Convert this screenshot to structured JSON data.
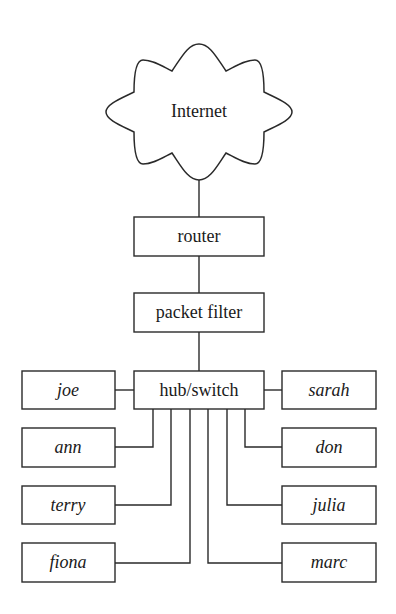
{
  "diagram": {
    "type": "network-topology",
    "colors": {
      "stroke": "#2a2a2a",
      "text": "#1a1a1a",
      "background": "#ffffff"
    },
    "nodes": {
      "internet": {
        "label": "Internet",
        "shape": "cloud"
      },
      "router": {
        "label": "router",
        "shape": "box"
      },
      "packet_filter": {
        "label": "packet filter",
        "shape": "box"
      },
      "hub": {
        "label": "hub/switch",
        "shape": "box"
      }
    },
    "hosts_left": [
      {
        "label": "joe"
      },
      {
        "label": "ann"
      },
      {
        "label": "terry"
      },
      {
        "label": "fiona"
      }
    ],
    "hosts_right": [
      {
        "label": "sarah"
      },
      {
        "label": "don"
      },
      {
        "label": "julia"
      },
      {
        "label": "marc"
      }
    ],
    "edges": [
      [
        "Internet",
        "router"
      ],
      [
        "router",
        "packet filter"
      ],
      [
        "packet filter",
        "hub/switch"
      ],
      [
        "hub/switch",
        "joe"
      ],
      [
        "hub/switch",
        "sarah"
      ],
      [
        "hub/switch",
        "ann"
      ],
      [
        "hub/switch",
        "terry"
      ],
      [
        "hub/switch",
        "fiona"
      ],
      [
        "hub/switch",
        "marc"
      ],
      [
        "hub/switch",
        "julia"
      ],
      [
        "hub/switch",
        "don"
      ]
    ]
  }
}
